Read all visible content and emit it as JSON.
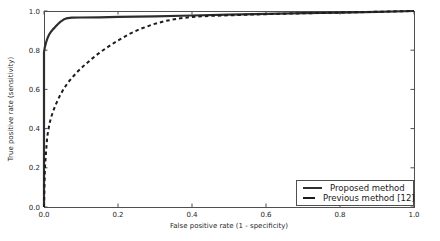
{
  "figure": {
    "background": "#ffffff",
    "text_color": "#262626",
    "spine_color": "#4f4f4f"
  },
  "chart_data": {
    "type": "line",
    "title": "",
    "xlabel": "False positive rate (1 - specificity)",
    "ylabel": "True positive rate (sensitivity)",
    "xlim": [
      0.0,
      1.0
    ],
    "ylim": [
      0.0,
      1.0
    ],
    "xticks": [
      "0.0",
      "0.2",
      "0.4",
      "0.6",
      "0.8",
      "1.0"
    ],
    "yticks": [
      "0.0",
      "0.2",
      "0.4",
      "0.6",
      "0.8",
      "1.0"
    ],
    "grid": false,
    "legend_position": "lower right",
    "series": [
      {
        "name": "Proposed method",
        "style": "solid",
        "color": "#2e2e2e",
        "width": 2.2,
        "points": [
          [
            0.0,
            0.0
          ],
          [
            0.0,
            0.79
          ],
          [
            0.002,
            0.812
          ],
          [
            0.004,
            0.828
          ],
          [
            0.006,
            0.842
          ],
          [
            0.008,
            0.854
          ],
          [
            0.01,
            0.864
          ],
          [
            0.013,
            0.876
          ],
          [
            0.016,
            0.886
          ],
          [
            0.02,
            0.897
          ],
          [
            0.024,
            0.906
          ],
          [
            0.028,
            0.914
          ],
          [
            0.032,
            0.922
          ],
          [
            0.036,
            0.93
          ],
          [
            0.04,
            0.938
          ],
          [
            0.045,
            0.946
          ],
          [
            0.05,
            0.952
          ],
          [
            0.055,
            0.958
          ],
          [
            0.06,
            0.962
          ],
          [
            0.065,
            0.964
          ],
          [
            0.075,
            0.966
          ],
          [
            0.1,
            0.967
          ],
          [
            0.15,
            0.968
          ],
          [
            0.2,
            0.97
          ],
          [
            0.3,
            0.973
          ],
          [
            0.4,
            0.977
          ],
          [
            0.5,
            0.981
          ],
          [
            0.6,
            0.985
          ],
          [
            0.7,
            0.989
          ],
          [
            0.8,
            0.992
          ],
          [
            0.9,
            0.996
          ],
          [
            1.0,
            1.0
          ]
        ]
      },
      {
        "name": "Previous method [12]",
        "style": "dashed",
        "color": "#1c1c1c",
        "width": 2,
        "points": [
          [
            0.0,
            0.0
          ],
          [
            0.001,
            0.09
          ],
          [
            0.002,
            0.16
          ],
          [
            0.003,
            0.215
          ],
          [
            0.005,
            0.27
          ],
          [
            0.007,
            0.32
          ],
          [
            0.009,
            0.36
          ],
          [
            0.012,
            0.395
          ],
          [
            0.015,
            0.425
          ],
          [
            0.019,
            0.455
          ],
          [
            0.024,
            0.485
          ],
          [
            0.03,
            0.515
          ],
          [
            0.037,
            0.545
          ],
          [
            0.045,
            0.575
          ],
          [
            0.054,
            0.605
          ],
          [
            0.065,
            0.635
          ],
          [
            0.078,
            0.665
          ],
          [
            0.093,
            0.695
          ],
          [
            0.11,
            0.725
          ],
          [
            0.13,
            0.757
          ],
          [
            0.15,
            0.787
          ],
          [
            0.175,
            0.82
          ],
          [
            0.2,
            0.85
          ],
          [
            0.23,
            0.882
          ],
          [
            0.26,
            0.908
          ],
          [
            0.295,
            0.932
          ],
          [
            0.33,
            0.95
          ],
          [
            0.365,
            0.962
          ],
          [
            0.4,
            0.97
          ],
          [
            0.45,
            0.975
          ],
          [
            0.55,
            0.981
          ],
          [
            0.65,
            0.986
          ],
          [
            0.75,
            0.99
          ],
          [
            0.85,
            0.994
          ],
          [
            1.0,
            1.0
          ]
        ]
      }
    ]
  }
}
